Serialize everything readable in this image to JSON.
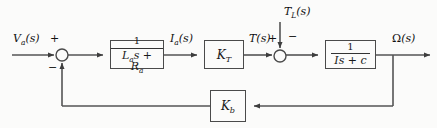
{
  "diagram": {
    "type": "control-system-block-diagram",
    "background_color": "#fbfbfa",
    "line_color": "#555555",
    "text_color": "#101010"
  },
  "signals": {
    "input": "V<sub>a</sub>(s)",
    "input_plain": "Va(s)",
    "armature_current": "I<sub>a</sub>(s)",
    "armature_current_plain": "Ia(s)",
    "torque": "T(s)",
    "load_torque": "T<sub>L</sub>(s)",
    "load_torque_plain": "TL(s)",
    "output": "Ω(s)",
    "output_plain": "Omega(s)"
  },
  "summing_junctions": [
    {
      "name": "input-summing-junction",
      "cx": 62,
      "cy": 55,
      "r": 6,
      "signs": [
        {
          "label": "+",
          "position": "top-left"
        },
        {
          "label": "−",
          "position": "bottom-left"
        }
      ]
    },
    {
      "name": "torque-summing-junction",
      "cx": 280,
      "cy": 56,
      "r": 6,
      "signs": [
        {
          "label": "+",
          "position": "top-left"
        },
        {
          "label": "−",
          "position": "top-right"
        }
      ]
    }
  ],
  "blocks": [
    {
      "name": "electrical-dynamics-block",
      "kind": "fraction",
      "numerator": "1",
      "denominator": "L<sub>a</sub>s + R<sub>a</sub>",
      "denominator_plain": "La s + Ra",
      "x": 110,
      "y": 40,
      "w": 54,
      "h": 29
    },
    {
      "name": "torque-constant-block",
      "kind": "gain",
      "label": "K<sub>T</sub>",
      "label_plain": "KT",
      "x": 204,
      "y": 40,
      "w": 40,
      "h": 29
    },
    {
      "name": "mechanical-dynamics-block",
      "kind": "fraction",
      "numerator": "1",
      "denominator": "Is + c",
      "denominator_plain": "Is + c",
      "x": 325,
      "y": 40,
      "w": 51,
      "h": 29
    },
    {
      "name": "back-emf-constant-block",
      "kind": "gain",
      "label": "K<sub>b</sub>",
      "label_plain": "Kb",
      "x": 210,
      "y": 90,
      "w": 36,
      "h": 32
    }
  ],
  "signs": {
    "plus": "+",
    "minus": "−"
  },
  "paths": {
    "forward_y": 55,
    "feedback_y": 106,
    "feedback_tap_x": 393,
    "feedback_return_x": 62,
    "load_torque_x": 280,
    "load_torque_top_y": 22
  }
}
